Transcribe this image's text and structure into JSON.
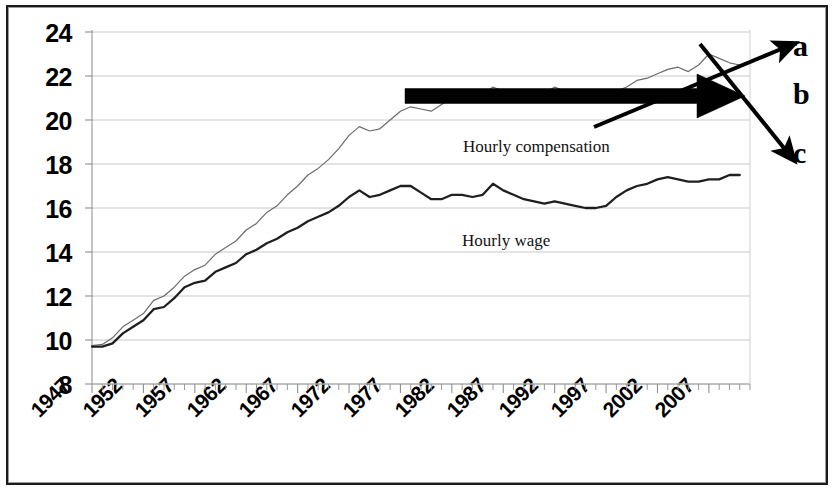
{
  "chart_data": {
    "type": "line",
    "title": "",
    "subtitle": "",
    "xlabel": "",
    "ylabel": "",
    "grid": true,
    "legend_position": "inline-annotation",
    "xlim": [
      1947,
      2011
    ],
    "ylim": [
      8,
      24
    ],
    "ytick_labels": [
      "24",
      "22",
      "20",
      "18",
      "16",
      "14",
      "12",
      "10",
      "8"
    ],
    "ytick_values": [
      24,
      22,
      20,
      18,
      16,
      14,
      12,
      10,
      8
    ],
    "xtick_labels": [
      "1947",
      "1952",
      "1957",
      "1962",
      "1967",
      "1972",
      "1977",
      "1982",
      "1987",
      "1992",
      "1997",
      "2002",
      "2007"
    ],
    "xtick_values": [
      1947,
      1952,
      1957,
      1962,
      1967,
      1972,
      1977,
      1982,
      1987,
      1992,
      1997,
      2002,
      2007
    ],
    "x": [
      1947,
      1948,
      1949,
      1950,
      1951,
      1952,
      1953,
      1954,
      1955,
      1956,
      1957,
      1958,
      1959,
      1960,
      1961,
      1962,
      1963,
      1964,
      1965,
      1966,
      1967,
      1968,
      1969,
      1970,
      1971,
      1972,
      1973,
      1974,
      1975,
      1976,
      1977,
      1978,
      1979,
      1980,
      1981,
      1982,
      1983,
      1984,
      1985,
      1986,
      1987,
      1988,
      1989,
      1990,
      1991,
      1992,
      1993,
      1994,
      1995,
      1996,
      1997,
      1998,
      1999,
      2000,
      2001,
      2002,
      2003,
      2004,
      2005,
      2006,
      2007,
      2008,
      2009,
      2010
    ],
    "series": [
      {
        "name": "Hourly compensation",
        "color": "#6b6b6b",
        "width": 1.2,
        "values": [
          9.75,
          9.8,
          10.1,
          10.6,
          10.9,
          11.2,
          11.8,
          12.0,
          12.4,
          12.9,
          13.2,
          13.4,
          13.9,
          14.2,
          14.5,
          15.0,
          15.3,
          15.8,
          16.1,
          16.6,
          17.0,
          17.5,
          17.8,
          18.2,
          18.7,
          19.3,
          19.7,
          19.5,
          19.6,
          20.0,
          20.4,
          20.6,
          20.5,
          20.4,
          20.7,
          21.0,
          21.1,
          21.0,
          21.1,
          21.5,
          21.3,
          21.2,
          21.0,
          21.1,
          21.2,
          21.5,
          21.3,
          21.2,
          21.1,
          21.0,
          20.9,
          21.3,
          21.5,
          21.8,
          21.9,
          22.1,
          22.3,
          22.4,
          22.2,
          22.5,
          23.0,
          22.8,
          22.6,
          22.5
        ]
      },
      {
        "name": "Hourly wage",
        "color": "#1f1f1f",
        "width": 2.3,
        "values": [
          9.7,
          9.7,
          9.85,
          10.3,
          10.6,
          10.9,
          11.4,
          11.5,
          11.9,
          12.4,
          12.6,
          12.7,
          13.1,
          13.3,
          13.5,
          13.9,
          14.1,
          14.4,
          14.6,
          14.9,
          15.1,
          15.4,
          15.6,
          15.8,
          16.1,
          16.5,
          16.8,
          16.5,
          16.6,
          16.8,
          17.0,
          17.0,
          16.7,
          16.4,
          16.4,
          16.6,
          16.6,
          16.5,
          16.6,
          17.1,
          16.8,
          16.6,
          16.4,
          16.3,
          16.2,
          16.3,
          16.2,
          16.1,
          16.0,
          16.0,
          16.1,
          16.5,
          16.8,
          17.0,
          17.1,
          17.3,
          17.4,
          17.3,
          17.2,
          17.2,
          17.3,
          17.3,
          17.5,
          17.5
        ]
      }
    ],
    "annotations": [
      {
        "id": "label-hourly-compensation",
        "text": "Hourly compensation",
        "x_px": 463,
        "y_px": 137
      },
      {
        "id": "label-hourly-wage",
        "text": "Hourly wage",
        "x_px": 462,
        "y_px": 231
      },
      {
        "id": "arrow-a-letter",
        "text": "a",
        "x_px": 793,
        "y_px": 31
      },
      {
        "id": "arrow-b-letter",
        "text": "b",
        "x_px": 793,
        "y_px": 79
      },
      {
        "id": "arrow-c-letter",
        "text": "c",
        "x_px": 793,
        "y_px": 138
      }
    ],
    "arrows": [
      {
        "id": "arrow-a",
        "label": "a",
        "direction": "up-right",
        "style": "thin",
        "from_px": [
          594,
          127
        ],
        "to_px": [
          786,
          47
        ]
      },
      {
        "id": "arrow-b",
        "label": "b",
        "direction": "right",
        "style": "thick",
        "from_px": [
          405,
          96
        ],
        "to_px": [
          745,
          96
        ]
      },
      {
        "id": "arrow-c",
        "label": "c",
        "direction": "down-right",
        "style": "thin",
        "from_px": [
          700,
          44
        ],
        "to_px": [
          788,
          153
        ]
      }
    ]
  }
}
